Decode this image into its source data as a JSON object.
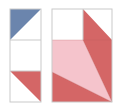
{
  "diagram": {
    "type": "tangram-tile-puzzle",
    "colors": {
      "blue": "#6b85ad",
      "red": "#d46666",
      "pink": "#f5c4cc",
      "grid_line": "#c9c9c9",
      "background": "#ffffff"
    },
    "left_column": {
      "cells": 3,
      "pieces": [
        {
          "name": "blue-triangle",
          "color_key": "blue",
          "cell": 1,
          "orientation": "top-left"
        },
        {
          "name": "red-triangle",
          "color_key": "red",
          "cell": 3,
          "orientation": "top-right"
        }
      ]
    },
    "right_panel": {
      "grid": "2x3",
      "pieces": [
        {
          "name": "red-triangle-top-right",
          "color_key": "red"
        },
        {
          "name": "pink-quadrilateral",
          "color_key": "pink"
        },
        {
          "name": "red-triangle-right",
          "color_key": "red"
        },
        {
          "name": "red-triangle-bottom",
          "color_key": "red"
        }
      ]
    }
  }
}
